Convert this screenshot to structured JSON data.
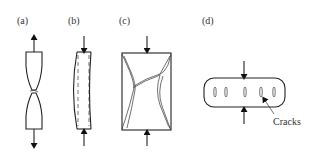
{
  "figure": {
    "panels": [
      {
        "id": "a",
        "label": "(a)",
        "description": "Tensile specimen necking and fracturing"
      },
      {
        "id": "b",
        "label": "(b)",
        "description": "Compression specimen bulging (barreling)"
      },
      {
        "id": "c",
        "label": "(c)",
        "description": "Compression specimen with shear fracture cracks"
      },
      {
        "id": "d",
        "label": "(d)",
        "description": "Transverse compression of cylinder with internal cracks"
      }
    ],
    "annotations": {
      "cracks_label": "Cracks"
    },
    "colors": {
      "line": "#222222",
      "background": "#ffffff"
    }
  }
}
